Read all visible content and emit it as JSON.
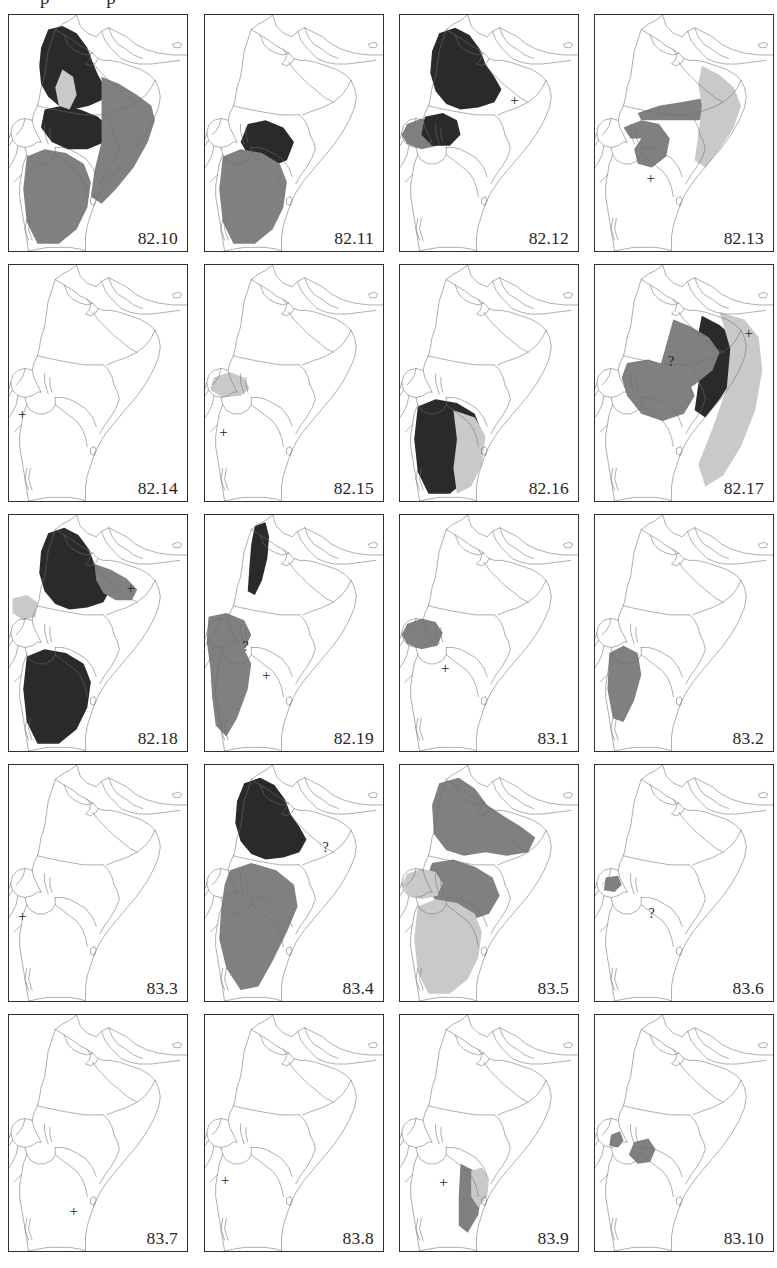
{
  "figure": {
    "clipped_header_text": "p      p",
    "shades": {
      "dark": "#2a2a2a",
      "medium": "#808080",
      "light": "#c9c9c9",
      "outline": "#6e6e6e",
      "border": "#2e2e2e",
      "background": "#ffffff"
    },
    "grid": {
      "columns": 4,
      "rows": 5,
      "panel_count": 20
    }
  },
  "chart_data": {
    "type": "table",
    "title": "",
    "panels": [
      {
        "label": "82.10",
        "row": 1,
        "col": 1,
        "regions": [
          {
            "shade": "dark",
            "area": "ethiopia-highlands"
          },
          {
            "shade": "dark",
            "area": "kenya-north"
          },
          {
            "shade": "medium",
            "area": "somalia"
          },
          {
            "shade": "medium",
            "area": "tanzania"
          },
          {
            "shade": "light",
            "area": "rift-valley-lakes"
          }
        ],
        "markers": []
      },
      {
        "label": "82.11",
        "row": 1,
        "col": 2,
        "regions": [
          {
            "shade": "dark",
            "area": "kenya-central"
          },
          {
            "shade": "medium",
            "area": "tanzania"
          }
        ],
        "markers": []
      },
      {
        "label": "82.12",
        "row": 1,
        "col": 3,
        "regions": [
          {
            "shade": "dark",
            "area": "ethiopia"
          },
          {
            "shade": "medium",
            "area": "uganda"
          },
          {
            "shade": "dark",
            "area": "kenya-west"
          }
        ],
        "markers": [
          {
            "type": "plus",
            "x": 62,
            "y": 33
          }
        ]
      },
      {
        "label": "82.13",
        "row": 1,
        "col": 4,
        "regions": [
          {
            "shade": "medium",
            "area": "somalia-south"
          },
          {
            "shade": "medium",
            "area": "kenya-arc"
          },
          {
            "shade": "light",
            "area": "somalia-coast"
          }
        ],
        "markers": [
          {
            "type": "plus",
            "x": 29,
            "y": 66
          }
        ]
      },
      {
        "label": "82.14",
        "row": 2,
        "col": 1,
        "regions": [],
        "markers": [
          {
            "type": "plus",
            "x": 5,
            "y": 60
          }
        ]
      },
      {
        "label": "82.15",
        "row": 2,
        "col": 2,
        "regions": [
          {
            "shade": "light",
            "area": "uganda-lake"
          }
        ],
        "markers": [
          {
            "type": "plus",
            "x": 8,
            "y": 68
          }
        ]
      },
      {
        "label": "82.16",
        "row": 2,
        "col": 3,
        "regions": [
          {
            "shade": "dark",
            "area": "tanzania"
          },
          {
            "shade": "light",
            "area": "tanzania-east"
          }
        ],
        "markers": []
      },
      {
        "label": "82.17",
        "row": 2,
        "col": 4,
        "regions": [
          {
            "shade": "dark",
            "area": "somalia-coast"
          },
          {
            "shade": "medium",
            "area": "somalia-inland"
          },
          {
            "shade": "medium",
            "area": "kenya"
          },
          {
            "shade": "light",
            "area": "indian-ocean-margin"
          }
        ],
        "markers": [
          {
            "type": "plus",
            "x": 84,
            "y": 26
          },
          {
            "type": "qmark",
            "x": 41,
            "y": 38
          }
        ]
      },
      {
        "label": "82.18",
        "row": 3,
        "col": 1,
        "regions": [
          {
            "shade": "dark",
            "area": "ethiopia"
          },
          {
            "shade": "dark",
            "area": "tanzania"
          },
          {
            "shade": "medium",
            "area": "ethiopia-east"
          },
          {
            "shade": "light",
            "area": "sudan-border"
          }
        ],
        "markers": [
          {
            "type": "plus",
            "x": 66,
            "y": 28
          }
        ]
      },
      {
        "label": "82.19",
        "row": 3,
        "col": 2,
        "regions": [
          {
            "shade": "dark",
            "area": "eritrea-strip"
          },
          {
            "shade": "medium",
            "area": "uganda-tanzania"
          }
        ],
        "markers": [
          {
            "type": "plus",
            "x": 32,
            "y": 65
          },
          {
            "type": "qmark",
            "x": 21,
            "y": 53
          }
        ]
      },
      {
        "label": "83.1",
        "row": 3,
        "col": 3,
        "regions": [
          {
            "shade": "medium",
            "area": "uganda"
          }
        ],
        "markers": [
          {
            "type": "plus",
            "x": 23,
            "y": 62
          }
        ]
      },
      {
        "label": "83.2",
        "row": 3,
        "col": 4,
        "regions": [
          {
            "shade": "medium",
            "area": "tanzania-west"
          }
        ],
        "markers": []
      },
      {
        "label": "83.3",
        "row": 4,
        "col": 1,
        "regions": [],
        "markers": [
          {
            "type": "plus",
            "x": 5,
            "y": 61
          }
        ]
      },
      {
        "label": "83.4",
        "row": 4,
        "col": 2,
        "regions": [
          {
            "shade": "dark",
            "area": "ethiopia"
          },
          {
            "shade": "medium",
            "area": "kenya-tanzania"
          }
        ],
        "markers": [
          {
            "type": "qmark",
            "x": 66,
            "y": 32
          }
        ]
      },
      {
        "label": "83.5",
        "row": 4,
        "col": 3,
        "regions": [
          {
            "shade": "medium",
            "area": "ethiopia-somalia"
          },
          {
            "shade": "medium",
            "area": "kenya"
          },
          {
            "shade": "light",
            "area": "uganda"
          },
          {
            "shade": "light",
            "area": "tanzania"
          }
        ],
        "markers": []
      },
      {
        "label": "83.6",
        "row": 4,
        "col": 4,
        "regions": [
          {
            "shade": "medium",
            "area": "uganda-small"
          }
        ],
        "markers": [
          {
            "type": "qmark",
            "x": 30,
            "y": 60
          }
        ]
      },
      {
        "label": "83.7",
        "row": 5,
        "col": 1,
        "regions": [],
        "markers": [
          {
            "type": "plus",
            "x": 34,
            "y": 80
          }
        ]
      },
      {
        "label": "83.8",
        "row": 5,
        "col": 2,
        "regions": [],
        "markers": [
          {
            "type": "plus",
            "x": 9,
            "y": 67
          }
        ]
      },
      {
        "label": "83.9",
        "row": 5,
        "col": 3,
        "regions": [
          {
            "shade": "medium",
            "area": "tanzania-coast"
          },
          {
            "shade": "light",
            "area": "kenya-coast"
          }
        ],
        "markers": [
          {
            "type": "plus",
            "x": 22,
            "y": 68
          }
        ]
      },
      {
        "label": "83.10",
        "row": 5,
        "col": 4,
        "regions": [
          {
            "shade": "medium",
            "area": "uganda-blob"
          },
          {
            "shade": "medium",
            "area": "kenya-blob"
          }
        ],
        "markers": []
      }
    ]
  }
}
